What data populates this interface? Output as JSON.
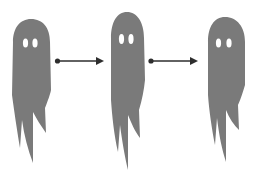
{
  "figure": {
    "background_color": "#ffffff",
    "ghost_color": "#7a7a7a",
    "eye_color": "#ffffff",
    "arrow_color": "#2e2e2e"
  },
  "ghosts": [
    {
      "id": "ghost-1",
      "label": ""
    },
    {
      "id": "ghost-2",
      "label": ""
    },
    {
      "id": "ghost-3",
      "label": ""
    }
  ],
  "arrows": [
    {
      "from": "ghost-1",
      "to": "ghost-2",
      "direction": "right"
    },
    {
      "from": "ghost-2",
      "to": "ghost-3",
      "direction": "right"
    }
  ]
}
